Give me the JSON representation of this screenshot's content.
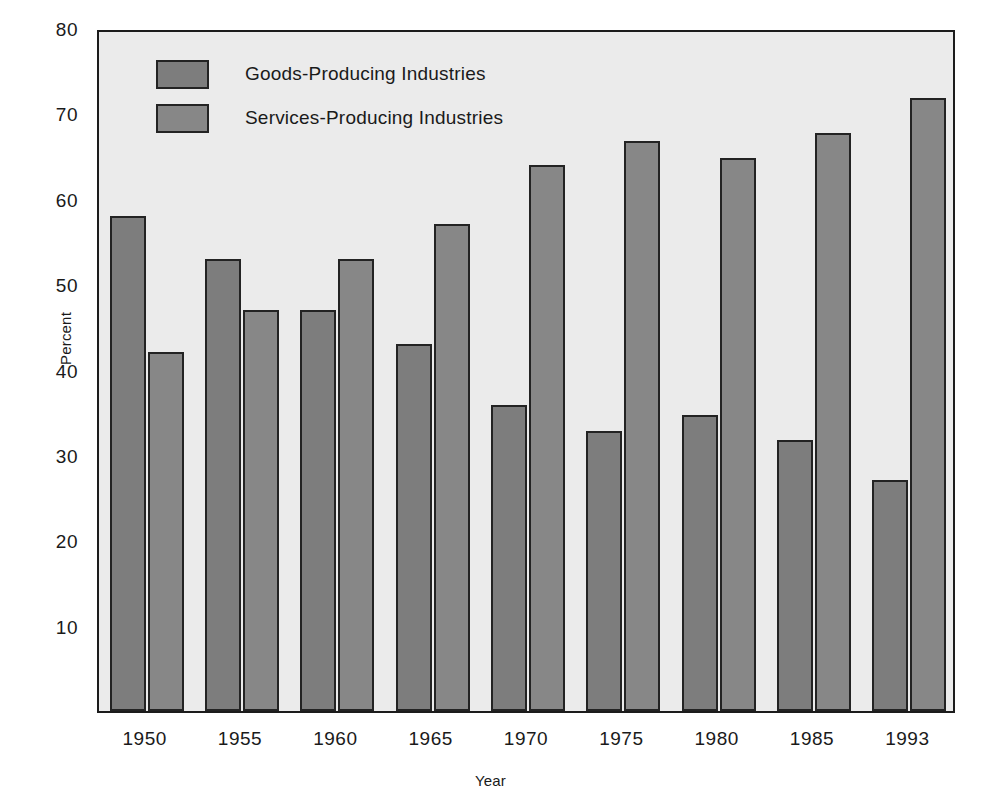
{
  "chart_data": {
    "type": "bar",
    "title": "",
    "xlabel": "Year",
    "ylabel": "Percent",
    "ylim": [
      0,
      80
    ],
    "yticks": [
      10,
      20,
      30,
      40,
      50,
      60,
      70,
      80
    ],
    "grid": false,
    "legend_position": "upper-left-inside",
    "categories": [
      "1950",
      "1955",
      "1960",
      "1965",
      "1970",
      "1975",
      "1980",
      "1985",
      "1993"
    ],
    "series": [
      {
        "name": "Goods-Producing Industries",
        "color": "#7d7d7d",
        "values": [
          58,
          53,
          47,
          43,
          35.9,
          32.8,
          34.7,
          31.7,
          27.1
        ]
      },
      {
        "name": "Services-Producing Industries",
        "color": "#878787",
        "values": [
          42,
          47,
          53,
          57,
          63.9,
          66.8,
          64.8,
          67.7,
          71.8
        ]
      }
    ]
  },
  "axes": {
    "ylabel": "Percent",
    "xlabel": "Year",
    "ytick_labels": [
      "80",
      "70",
      "60",
      "50",
      "40",
      "30",
      "20",
      "10"
    ],
    "xtick_labels": [
      "1950",
      "1955",
      "1960",
      "1965",
      "1970",
      "1975",
      "1980",
      "1985",
      "1993"
    ]
  },
  "legend": {
    "items": [
      {
        "label": "Goods-Producing Industries",
        "color": "#7d7d7d"
      },
      {
        "label": "Services-Producing Industries",
        "color": "#878787"
      }
    ]
  },
  "colors": {
    "page_background": "#ffffff",
    "plot_background": "#ebebeb",
    "axis": "#1c1c1c",
    "goods_bar": "#7d7d7d",
    "services_bar": "#878787"
  }
}
